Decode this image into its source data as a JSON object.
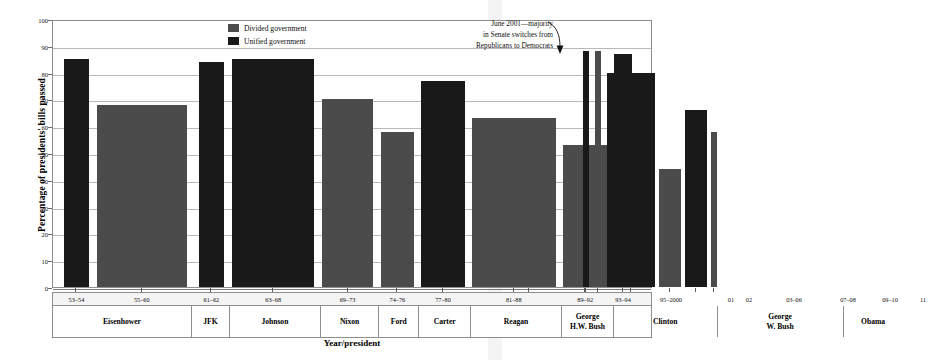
{
  "chart_data": {
    "type": "bar",
    "title": "",
    "xlabel": "Year/president",
    "ylabel": "Percentage of presidents' bills passed",
    "ylim": [
      0,
      100
    ],
    "ytick_step": 10,
    "yticks": [
      0,
      10,
      20,
      30,
      40,
      50,
      60,
      70,
      80,
      90,
      100
    ],
    "grid": true,
    "legend_position": "top-center",
    "legend": [
      {
        "key": "divided",
        "label": "Divided government",
        "color": "#4b4b4b"
      },
      {
        "key": "unified",
        "label": "Unified government",
        "color": "#191919"
      }
    ],
    "annotations": [
      {
        "lines": [
          "June 2001—majority",
          "in Senate switches from",
          "Republicans to Democrats"
        ],
        "points_to": "01"
      }
    ],
    "categories": [
      "53–54",
      "55–60",
      "61–62",
      "63–68",
      "69–73",
      "74–76",
      "77–80",
      "81–88",
      "89–92",
      "93–94",
      "95–2000",
      "01",
      "02",
      "03–06",
      "07–08",
      "09–10",
      "11"
    ],
    "values": [
      85,
      68,
      84,
      85,
      70,
      58,
      77,
      63,
      53,
      87,
      49,
      88,
      88,
      80,
      44,
      66,
      58
    ],
    "types": [
      "unified",
      "divided",
      "unified",
      "unified",
      "divided",
      "divided",
      "unified",
      "divided",
      "divided",
      "unified",
      "divided",
      "unified",
      "divided",
      "unified",
      "divided",
      "unified",
      "divided"
    ],
    "bars": [
      {
        "label": "53–54",
        "value": 85,
        "type": "unified",
        "president": "Eisenhower",
        "left_pct": 1.8,
        "width_pct": 4.2
      },
      {
        "label": "55–60",
        "value": 68,
        "type": "divided",
        "president": "Eisenhower",
        "left_pct": 7.3,
        "width_pct": 15.0
      },
      {
        "label": "61–62",
        "value": 84,
        "type": "unified",
        "president": "JFK",
        "left_pct": 24.3,
        "width_pct": 4.2
      },
      {
        "label": "63–68",
        "value": 85,
        "type": "unified",
        "president": "Johnson",
        "left_pct": 29.8,
        "width_pct": 13.7
      },
      {
        "label": "69–73",
        "value": 70,
        "type": "divided",
        "president": "Nixon",
        "left_pct": 44.8,
        "width_pct": 8.6
      },
      {
        "label": "74–76",
        "value": 58,
        "type": "divided",
        "president": "Ford",
        "left_pct": 54.6,
        "width_pct": 5.5
      },
      {
        "label": "77–80",
        "value": 77,
        "type": "unified",
        "president": "Carter",
        "left_pct": 61.3,
        "width_pct": 7.3
      },
      {
        "label": "81–88",
        "value": 63,
        "type": "divided",
        "president": "Reagan",
        "left_pct": 69.8,
        "width_pct": 14.0
      },
      {
        "label": "89–92",
        "value": 53,
        "type": "divided",
        "president": "George H.W. Bush",
        "left_pct": 85.0,
        "width_pct": 7.3
      },
      {
        "label": "93–94",
        "value": 87,
        "type": "unified",
        "president": "Clinton",
        "left_pct": 93.5,
        "width_pct": 3.0
      }
    ],
    "bars_overflow": [
      {
        "label": "95–2000",
        "value": 49,
        "type": "divided",
        "president": "Clinton",
        "left_px": 450,
        "width_px": 52
      },
      {
        "label": "01",
        "value": 88,
        "type": "unified",
        "president": "George W. Bush",
        "left_px": 530,
        "width_px": 6
      },
      {
        "label": "02",
        "value": 88,
        "type": "divided",
        "president": "George W. Bush",
        "left_px": 542,
        "width_px": 6
      },
      {
        "label": "03–06",
        "value": 80,
        "type": "unified",
        "president": "George W. Bush",
        "left_px": 554,
        "width_px": 48
      },
      {
        "label": "07–08",
        "value": 44,
        "type": "divided",
        "president": "George W. Bush",
        "left_px": 606,
        "width_px": 22
      },
      {
        "label": "09–10",
        "value": 66,
        "type": "unified",
        "president": "Obama",
        "left_px": 632,
        "width_px": 22
      },
      {
        "label": "11",
        "value": 58,
        "type": "divided",
        "president": "Obama",
        "left_px": 658,
        "width_px": 6
      }
    ],
    "year_cells": [
      {
        "label": "53–54",
        "center_pct": 3.9
      },
      {
        "label": "55–60",
        "center_pct": 14.8
      },
      {
        "label": "61–62",
        "center_pct": 26.4
      },
      {
        "label": "63–68",
        "center_pct": 36.7
      },
      {
        "label": "69–73",
        "center_pct": 49.1
      },
      {
        "label": "74–76",
        "center_pct": 57.4
      },
      {
        "label": "77–80",
        "center_pct": 65.0
      },
      {
        "label": "81–88",
        "center_pct": 76.8
      },
      {
        "label": "89–92",
        "center_pct": 88.7
      },
      {
        "label": "93–94",
        "center_pct": 95.0
      },
      {
        "label": "95–2000",
        "center_pct": 103.0
      },
      {
        "label": "01",
        "center_pct": 113.0
      },
      {
        "label": "02",
        "center_pct": 116.0
      },
      {
        "label": "03–06",
        "center_pct": 123.5
      },
      {
        "label": "07–08",
        "center_pct": 132.5
      },
      {
        "label": "09–10",
        "center_pct": 139.5
      },
      {
        "label": "11",
        "center_pct": 145.0
      }
    ],
    "president_cells": [
      {
        "name": "Eisenhower",
        "line1": "Eisenhower",
        "line2": "",
        "left_pct": 0.0,
        "width_pct": 23.0
      },
      {
        "name": "JFK",
        "line1": "JFK",
        "line2": "",
        "left_pct": 23.0,
        "width_pct": 6.3
      },
      {
        "name": "Johnson",
        "line1": "Johnson",
        "line2": "",
        "left_pct": 29.3,
        "width_pct": 15.2
      },
      {
        "name": "Nixon",
        "line1": "Nixon",
        "line2": "",
        "left_pct": 44.5,
        "width_pct": 9.7
      },
      {
        "name": "Ford",
        "line1": "Ford",
        "line2": "",
        "left_pct": 54.2,
        "width_pct": 6.7
      },
      {
        "name": "Carter",
        "line1": "Carter",
        "line2": "",
        "left_pct": 60.9,
        "width_pct": 8.6
      },
      {
        "name": "Reagan",
        "line1": "Reagan",
        "line2": "",
        "left_pct": 69.5,
        "width_pct": 15.2
      },
      {
        "name": "George H.W. Bush",
        "line1": "George",
        "line2": "H.W. Bush",
        "left_pct": 84.7,
        "width_pct": 8.6
      },
      {
        "name": "Clinton",
        "line1": "Clinton",
        "line2": "",
        "left_pct": 93.3,
        "width_pct": 17.3
      },
      {
        "name": "George W. Bush",
        "line1": "George",
        "line2": "W. Bush",
        "left_pct": 110.6,
        "width_pct": 21.0
      },
      {
        "name": "Obama",
        "line1": "Obama",
        "line2": "",
        "left_pct": 131.6,
        "width_pct": 10.0
      }
    ]
  }
}
